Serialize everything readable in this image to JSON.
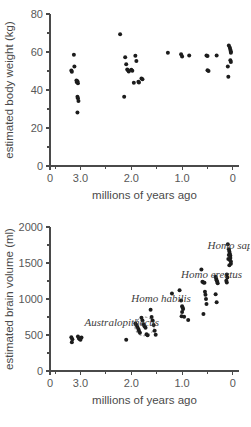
{
  "figure": {
    "background": "#ffffff",
    "dot_color": "#1c1c1c",
    "axis_color": "#4a4a4a"
  },
  "chart_data": [
    {
      "type": "scatter",
      "id": "body-weight",
      "title": "",
      "xlabel": "millions of years ago",
      "ylabel": "estimated body weight (kg)",
      "xlim": [
        3.6,
        -0.12
      ],
      "ylim": [
        0,
        80
      ],
      "x_ticks": [
        3.6,
        3.0,
        2.0,
        1.0,
        0.0
      ],
      "x_tick_labels": [
        "0",
        "3.0",
        "2.0",
        "1.0",
        "0"
      ],
      "x_minor_ticks": [
        3.5,
        2.5,
        1.5,
        0.5
      ],
      "y_ticks": [
        0,
        20,
        40,
        60,
        80
      ],
      "y_tick_labels": [
        "0",
        "20",
        "40",
        "60",
        "80"
      ],
      "y_minor_ticks": [
        10,
        30,
        50,
        70
      ],
      "grid": false,
      "legend": "none",
      "points": [
        [
          3.18,
          50.2
        ],
        [
          3.17,
          49.6
        ],
        [
          3.13,
          58.6
        ],
        [
          3.12,
          52.4
        ],
        [
          3.08,
          45.0
        ],
        [
          3.07,
          44.1
        ],
        [
          3.06,
          44.6
        ],
        [
          3.05,
          43.6
        ],
        [
          3.06,
          36.4
        ],
        [
          3.05,
          35.6
        ],
        [
          3.04,
          34.2
        ],
        [
          3.06,
          28.2
        ],
        [
          2.22,
          69.4
        ],
        [
          2.12,
          57.2
        ],
        [
          2.1,
          53.5
        ],
        [
          2.08,
          50.8
        ],
        [
          2.06,
          50.2
        ],
        [
          2.05,
          49.8
        ],
        [
          2.0,
          50.6
        ],
        [
          1.98,
          50.1
        ],
        [
          1.95,
          43.8
        ],
        [
          1.92,
          58.0
        ],
        [
          1.9,
          55.2
        ],
        [
          1.86,
          44.4
        ],
        [
          1.85,
          43.9
        ],
        [
          1.8,
          46.1
        ],
        [
          1.78,
          45.6
        ],
        [
          2.14,
          36.4
        ],
        [
          1.28,
          59.6
        ],
        [
          1.02,
          58.8
        ],
        [
          1.0,
          57.6
        ],
        [
          0.86,
          58.2
        ],
        [
          0.52,
          58.2
        ],
        [
          0.5,
          57.9
        ],
        [
          0.5,
          50.4
        ],
        [
          0.48,
          50.0
        ],
        [
          0.32,
          58.2
        ],
        [
          0.08,
          63.4
        ],
        [
          0.06,
          62.2
        ],
        [
          0.05,
          61.2
        ],
        [
          0.04,
          60.2
        ],
        [
          0.04,
          59.6
        ],
        [
          0.05,
          55.6
        ],
        [
          0.04,
          54.8
        ],
        [
          0.1,
          52.4
        ],
        [
          0.09,
          47.0
        ]
      ]
    },
    {
      "type": "scatter",
      "id": "brain-volume",
      "title": "",
      "xlabel": "millions of years ago",
      "ylabel": "estimated brain volume (ml)",
      "xlim": [
        3.6,
        -0.12
      ],
      "ylim": [
        0,
        2000
      ],
      "x_ticks": [
        3.6,
        3.0,
        2.0,
        1.0,
        0.0
      ],
      "x_tick_labels": [
        "0",
        "3.0",
        "2.0",
        "1.0",
        "0"
      ],
      "x_minor_ticks": [
        3.5,
        2.5,
        1.5,
        0.5
      ],
      "y_ticks": [
        0,
        500,
        1000,
        1500,
        2000
      ],
      "y_tick_labels": [
        "0",
        "500",
        "1000",
        "1500",
        "2000"
      ],
      "y_minor_ticks": [
        250,
        750,
        1250,
        1750
      ],
      "grid": false,
      "legend": "none",
      "annotations": [
        {
          "text": "Australopithecus",
          "x": 2.92,
          "y": 620
        },
        {
          "text": "Homo habilis",
          "x": 2.0,
          "y": 960
        },
        {
          "text": "Homo erectus",
          "x": 1.02,
          "y": 1290
        },
        {
          "text": "Homo sapiens",
          "x": 0.5,
          "y": 1700
        }
      ],
      "points": [
        [
          3.18,
          470
        ],
        [
          3.16,
          440
        ],
        [
          3.17,
          400
        ],
        [
          3.05,
          480
        ],
        [
          3.03,
          450
        ],
        [
          3.01,
          440
        ],
        [
          2.98,
          465
        ],
        [
          3.0,
          435
        ],
        [
          2.1,
          435
        ],
        [
          1.92,
          660
        ],
        [
          1.9,
          640
        ],
        [
          1.88,
          610
        ],
        [
          1.86,
          585
        ],
        [
          1.85,
          560
        ],
        [
          1.83,
          530
        ],
        [
          1.8,
          740
        ],
        [
          1.78,
          700
        ],
        [
          1.76,
          650
        ],
        [
          1.74,
          620
        ],
        [
          1.72,
          600
        ],
        [
          1.7,
          510
        ],
        [
          1.68,
          495
        ],
        [
          1.62,
          850
        ],
        [
          1.6,
          750
        ],
        [
          1.58,
          700
        ],
        [
          1.56,
          640
        ],
        [
          1.54,
          560
        ],
        [
          1.52,
          505
        ],
        [
          1.2,
          1075
        ],
        [
          1.05,
          1120
        ],
        [
          1.02,
          980
        ],
        [
          1.0,
          900
        ],
        [
          0.99,
          880
        ],
        [
          0.98,
          860
        ],
        [
          1.0,
          820
        ],
        [
          1.01,
          760
        ],
        [
          0.96,
          755
        ],
        [
          0.88,
          710
        ],
        [
          0.62,
          1410
        ],
        [
          0.6,
          1240
        ],
        [
          0.58,
          1230
        ],
        [
          0.56,
          1225
        ],
        [
          0.55,
          1100
        ],
        [
          0.54,
          1060
        ],
        [
          0.53,
          1000
        ],
        [
          0.52,
          930
        ],
        [
          0.58,
          790
        ],
        [
          0.34,
          1310
        ],
        [
          0.33,
          1280
        ],
        [
          0.32,
          1260
        ],
        [
          0.31,
          1240
        ],
        [
          0.3,
          1220
        ],
        [
          0.34,
          1065
        ],
        [
          0.32,
          955
        ],
        [
          0.1,
          1760
        ],
        [
          0.08,
          1690
        ],
        [
          0.07,
          1660
        ],
        [
          0.06,
          1630
        ],
        [
          0.05,
          1600
        ],
        [
          0.05,
          1570
        ],
        [
          0.06,
          1540
        ],
        [
          0.04,
          1520
        ],
        [
          0.04,
          1490
        ],
        [
          0.08,
          1610
        ],
        [
          0.09,
          1555
        ],
        [
          0.07,
          1470
        ],
        [
          0.12,
          1340
        ],
        [
          0.11,
          1300
        ],
        [
          0.13,
          1255
        ],
        [
          0.12,
          1230
        ]
      ],
      "outline": {
        "description": "dashed ellipse around Homo habilis cluster",
        "cx": 1.74,
        "cy": 620,
        "rx": 0.19,
        "ry": 130,
        "rotation": -28
      }
    }
  ]
}
